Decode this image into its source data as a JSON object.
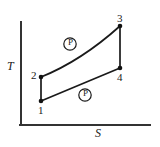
{
  "figure": {
    "axes": {
      "y_label": "T",
      "x_label": "S",
      "y_axis_x": 21,
      "y_axis_top": 22,
      "y_axis_bottom": 125,
      "x_axis_y": 125,
      "x_axis_left": 21,
      "x_axis_right": 150,
      "color": "#333333",
      "width": 2
    },
    "states": [
      {
        "id": "1",
        "label": "1",
        "x": 41,
        "y": 101
      },
      {
        "id": "2",
        "label": "2",
        "x": 41,
        "y": 77
      },
      {
        "id": "3",
        "label": "3",
        "x": 120,
        "y": 26
      },
      {
        "id": "4",
        "label": "4",
        "x": 120,
        "y": 68
      }
    ],
    "paths": [
      {
        "name": "process-1-2",
        "from": "1",
        "to": "2",
        "kind": "vertical"
      },
      {
        "name": "process-2-3",
        "from": "2",
        "to": "3",
        "kind": "curve-bowed"
      },
      {
        "name": "process-3-4",
        "from": "3",
        "to": "4",
        "kind": "vertical"
      },
      {
        "name": "process-4-1",
        "from": "4",
        "to": "1",
        "kind": "line"
      }
    ],
    "process_labels": [
      {
        "name": "process-label-upper",
        "label": "P",
        "x": 70,
        "y": 44
      },
      {
        "name": "process-label-lower",
        "label": "P",
        "x": 85,
        "y": 95
      }
    ],
    "style": {
      "line_color": "#1a1a1a",
      "marker_color": "#111111",
      "marker_radius": 2.3,
      "stroke_width": 1.7,
      "circle_radius": 6.2
    }
  }
}
